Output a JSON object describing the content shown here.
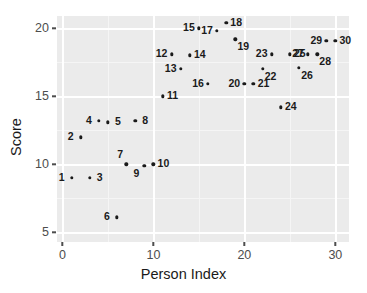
{
  "chart_data": {
    "type": "scatter",
    "title": "",
    "xlabel": "Person Index",
    "ylabel": "Score",
    "xlim": [
      -0.6,
      31.5
    ],
    "ylim": [
      4.3,
      20.9
    ],
    "xticks": [
      0,
      10,
      20,
      30
    ],
    "yticks": [
      5,
      10,
      15,
      20
    ],
    "xtick_labels": [
      "0",
      "10",
      "20",
      "30"
    ],
    "ytick_labels": [
      "5",
      "10",
      "15",
      "20"
    ],
    "grid": true,
    "legend": "none",
    "panel_color": "#ebebeb",
    "grid_color": "#ffffff",
    "point_color": "#1a1a1a",
    "x": [
      1,
      2,
      3,
      4,
      5,
      6,
      7,
      8,
      9,
      10,
      11,
      12,
      13,
      14,
      15,
      16,
      17,
      18,
      19,
      20,
      21,
      22,
      23,
      24,
      25,
      26,
      27,
      28,
      29,
      30
    ],
    "y": [
      9.0,
      12.0,
      9.0,
      13.2,
      13.1,
      6.1,
      10.0,
      13.2,
      9.9,
      10.0,
      15.0,
      18.1,
      17.0,
      18.0,
      20.0,
      15.9,
      19.8,
      20.4,
      19.2,
      15.9,
      15.9,
      17.0,
      18.1,
      14.2,
      18.1,
      17.1,
      18.1,
      18.1,
      19.1,
      19.1
    ],
    "labels": [
      "1",
      "2",
      "3",
      "4",
      "5",
      "6",
      "7",
      "8",
      "9",
      "10",
      "11",
      "12",
      "13",
      "14",
      "15",
      "16",
      "17",
      "18",
      "19",
      "20",
      "21",
      "22",
      "23",
      "24",
      "25",
      "26",
      "27",
      "28",
      "29",
      "30"
    ],
    "label_positions": [
      "left",
      "left",
      "right",
      "left",
      "right",
      "left",
      "above-left",
      "right",
      "below-left",
      "right",
      "right",
      "left",
      "left",
      "right",
      "left",
      "left",
      "left",
      "right",
      "below-right",
      "left",
      "right",
      "below-right",
      "left",
      "right",
      "right",
      "below-right",
      "left",
      "below-right",
      "left",
      "right"
    ]
  }
}
